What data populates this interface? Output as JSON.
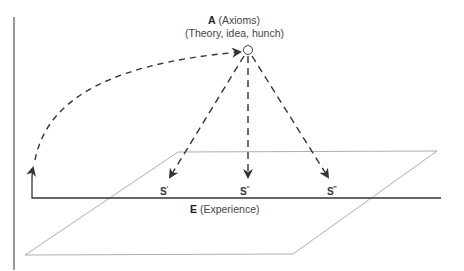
{
  "diagram": {
    "axioms": {
      "letter": "A",
      "name": "(Axioms)",
      "description": "(Theory, idea, hunch)"
    },
    "experience": {
      "letter": "E",
      "name": "(Experience)"
    },
    "statements": [
      {
        "letter": "S",
        "primes": "′"
      },
      {
        "letter": "S",
        "primes": "″"
      },
      {
        "letter": "S",
        "primes": "‴"
      }
    ],
    "colors": {
      "line": "#333333",
      "plane": "#999999",
      "text": "#444444"
    }
  }
}
